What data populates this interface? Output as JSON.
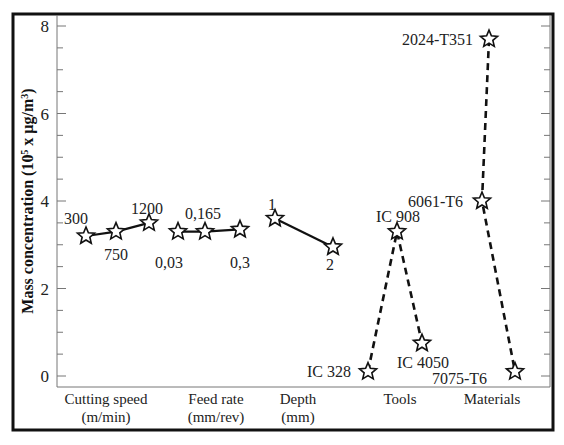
{
  "chart_data": {
    "type": "line",
    "title": "",
    "ylabel": "Mass concentration (10^5 x µg/m^3)",
    "ylabel_parts": {
      "main": "Mass concentration (10",
      "sup1": "5",
      "mid": " x µg/m",
      "sup2": "3",
      "end": ")"
    },
    "ylim": [
      0,
      8
    ],
    "yticks": [
      0,
      2,
      4,
      6,
      8
    ],
    "y_minor_step": 0.5,
    "grid": false,
    "legend": null,
    "marker": "star",
    "groups": [
      {
        "name": "Cutting speed",
        "unit": "(m/min)",
        "line_style": "solid",
        "points": [
          {
            "label": "300",
            "value": 3.2
          },
          {
            "label": "750",
            "value": 3.3
          },
          {
            "label": "1200",
            "value": 3.5
          }
        ]
      },
      {
        "name": "Feed rate",
        "unit": "(mm/rev)",
        "line_style": "solid",
        "points": [
          {
            "label": "0,03",
            "value": 3.3
          },
          {
            "label": "0,165",
            "value": 3.3
          },
          {
            "label": "0,3",
            "value": 3.35
          }
        ]
      },
      {
        "name": "Depth",
        "unit": "(mm)",
        "line_style": "solid",
        "points": [
          {
            "label": "1",
            "value": 3.6
          },
          {
            "label": "2",
            "value": 2.95
          }
        ]
      },
      {
        "name": "Tools",
        "unit": "",
        "line_style": "dashed",
        "points": [
          {
            "label": "IC 328",
            "value": 0.1
          },
          {
            "label": "IC 908",
            "value": 3.3
          },
          {
            "label": "IC 4050",
            "value": 0.75
          }
        ]
      },
      {
        "name": "Materials",
        "unit": "",
        "line_style": "dashed",
        "points": [
          {
            "label": "2024-T351",
            "value": 7.7
          },
          {
            "label": "6061-T6",
            "value": 4.0
          },
          {
            "label": "7075-T6",
            "value": 0.1
          }
        ]
      }
    ]
  },
  "layout": {
    "frame": {
      "x": 13,
      "y": 14,
      "w": 540,
      "h": 416
    },
    "plot": {
      "x0": 57,
      "x1": 550,
      "y_top": 15,
      "y_bottom": 387,
      "y_zero": 376,
      "px_per_unit": 43.75
    },
    "point_x": [
      [
        86,
        116,
        149
      ],
      [
        178,
        205,
        240
      ],
      [
        275,
        333
      ],
      [
        368,
        397,
        422
      ],
      [
        489,
        482,
        515
      ]
    ],
    "label_pos": [
      [
        [
          64,
          224,
          "start"
        ],
        [
          104,
          260,
          "start"
        ],
        [
          131,
          214,
          "start"
        ]
      ],
      [
        [
          155,
          268,
          "start"
        ],
        [
          185,
          219,
          "start"
        ],
        [
          230,
          268,
          "start"
        ]
      ],
      [
        [
          268,
          210,
          "start"
        ],
        [
          326,
          270,
          "start"
        ]
      ],
      [
        [
          307,
          377,
          "start"
        ],
        [
          376,
          222,
          "start"
        ],
        [
          397,
          368,
          "start"
        ]
      ],
      [
        [
          402,
          45,
          "start"
        ],
        [
          408,
          207,
          "start"
        ],
        [
          432,
          384,
          "start"
        ]
      ]
    ],
    "cat_label_x": [
      106,
      216,
      298,
      400,
      492
    ]
  }
}
